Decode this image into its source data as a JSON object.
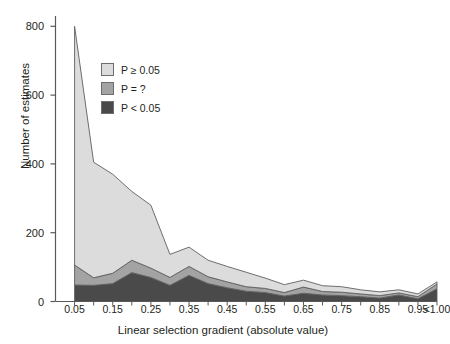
{
  "chart_data": {
    "type": "area",
    "stacked": true,
    "title": "",
    "subtitle": "",
    "xlabel": "Linear selection gradient (absolute value)",
    "ylabel": "Number of estimates",
    "grid": false,
    "legend_position": "upper-left-inside",
    "xlim": [
      0.0,
      1.0
    ],
    "ylim": [
      0,
      830
    ],
    "yticks": [
      0,
      200,
      400,
      600,
      800
    ],
    "ytick_labels": [
      "0",
      "200",
      "400",
      "600",
      "800"
    ],
    "x": [
      0.05,
      0.1,
      0.15,
      0.2,
      0.25,
      0.3,
      0.35,
      0.4,
      0.45,
      0.5,
      0.55,
      0.6,
      0.65,
      0.7,
      0.75,
      0.8,
      0.85,
      0.9,
      0.95,
      1.0
    ],
    "xtick_labels": [
      "0.05",
      "0.15",
      "0.25",
      "0.35",
      "0.45",
      "0.55",
      "0.65",
      "0.75",
      "0.85",
      "0.95",
      "<1.00"
    ],
    "xtick_values": [
      0.05,
      0.15,
      0.25,
      0.35,
      0.45,
      0.55,
      0.65,
      0.75,
      0.85,
      0.95,
      1.0
    ],
    "series": [
      {
        "name": "P < 0.05",
        "color": "#4a4a4a",
        "values": [
          48,
          47,
          52,
          84,
          70,
          47,
          76,
          52,
          40,
          30,
          26,
          16,
          24,
          19,
          17,
          14,
          10,
          19,
          8,
          37
        ]
      },
      {
        "name": "P = ?",
        "color": "#a3a3a3",
        "values": [
          58,
          22,
          30,
          36,
          27,
          23,
          26,
          20,
          17,
          13,
          12,
          10,
          18,
          10,
          10,
          8,
          7,
          6,
          6,
          14
        ]
      },
      {
        "name": "P ≥ 0.05",
        "color": "#dcdcdc",
        "values": [
          694,
          336,
          288,
          200,
          183,
          67,
          56,
          48,
          45,
          42,
          30,
          23,
          20,
          17,
          16,
          12,
          11,
          9,
          8,
          6
        ]
      }
    ],
    "totals": [
      800,
      405,
      370,
      320,
      280,
      137,
      158,
      120,
      102,
      85,
      68,
      49,
      62,
      46,
      43,
      34,
      28,
      34,
      22,
      57
    ]
  },
  "legend": {
    "items": [
      {
        "label": "P ≥ 0.05",
        "color": "#dcdcdc"
      },
      {
        "label": "P = ?",
        "color": "#a3a3a3"
      },
      {
        "label": "P < 0.05",
        "color": "#4a4a4a"
      }
    ]
  },
  "axes": {
    "y_title": "Number of estimates",
    "x_title": "Linear selection gradient (absolute value)",
    "y_tick_0": "0",
    "y_tick_1": "200",
    "y_tick_2": "400",
    "y_tick_3": "600",
    "y_tick_4": "800"
  },
  "colors": {
    "axis": "#58595b",
    "text": "#231f20",
    "outline": "#6e6e6e",
    "background": "#ffffff"
  }
}
